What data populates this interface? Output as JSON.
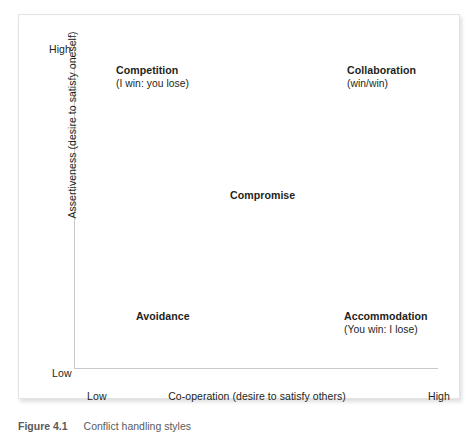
{
  "chart_data": {
    "type": "scatter",
    "title": "",
    "xlabel": "Co-operation (desire to satisfy others)",
    "ylabel": "Assertiveness (desire to satisfy oneself)",
    "x_ticks": [
      "Low",
      "High"
    ],
    "y_ticks": [
      "Low",
      "High"
    ],
    "xlim": [
      "Low",
      "High"
    ],
    "ylim": [
      "Low",
      "High"
    ],
    "grid": false,
    "legend": "none",
    "points": [
      {
        "label": "Competition",
        "sublabel": "(I win: you lose)",
        "x": "Low",
        "y": "High",
        "x_pct": 10,
        "y_pct": 92
      },
      {
        "label": "Collaboration",
        "sublabel": "(win/win)",
        "x": "High",
        "y": "High",
        "x_pct": 75,
        "y_pct": 92
      },
      {
        "label": "Compromise",
        "sublabel": "",
        "x": "Medium",
        "y": "Medium",
        "x_pct": 43,
        "y_pct": 55
      },
      {
        "label": "Avoidance",
        "sublabel": "",
        "x": "Low",
        "y": "Low",
        "x_pct": 16,
        "y_pct": 19
      },
      {
        "label": "Accommodation",
        "sublabel": "(You win: I lose)",
        "x": "High",
        "y": "Low",
        "x_pct": 74,
        "y_pct": 19
      }
    ]
  },
  "axes": {
    "y": {
      "title": "Assertiveness (desire to satisfy oneself)",
      "high_label": "High",
      "low_label": "Low"
    },
    "x": {
      "title": "Co-operation (desire to satisfy others)",
      "low_label": "Low",
      "high_label": "High"
    }
  },
  "quadrants": {
    "competition": {
      "title": "Competition",
      "subtitle": "(I win: you lose)"
    },
    "collaboration": {
      "title": "Collaboration",
      "subtitle": "(win/win)"
    },
    "compromise": {
      "title": "Compromise",
      "subtitle": ""
    },
    "avoidance": {
      "title": "Avoidance",
      "subtitle": ""
    },
    "accommodation": {
      "title": "Accommodation",
      "subtitle": "(You win: I lose)"
    }
  },
  "caption": {
    "number": "Figure 4.1",
    "text": "Conflict handling styles"
  },
  "colors": {
    "text": "#231f20",
    "axis_line": "#c9c9c9",
    "card_border": "#e3e3e3",
    "background": "#ffffff",
    "caption_text": "#5a5a5a"
  }
}
